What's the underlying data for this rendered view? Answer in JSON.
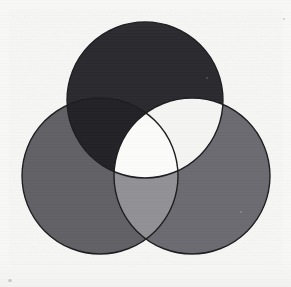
{
  "figure": {
    "type": "venn-3",
    "background_color": "#f7f7f5",
    "canvas": {
      "width": 291,
      "height": 287
    },
    "stroke": {
      "color": "#1d1d20",
      "width": 1.4
    }
  },
  "chart_data": {
    "type": "venn",
    "subtitle": "",
    "xlabel": "",
    "ylabel": "",
    "grid": false,
    "legend_position": "none",
    "sets": [
      {
        "id": "A",
        "label": "",
        "position": "top",
        "center": {
          "x": 145,
          "y": 100
        },
        "radius": 78,
        "fill": "#2b2b2f"
      },
      {
        "id": "B",
        "label": "",
        "position": "bottom-left",
        "center": {
          "x": 100,
          "y": 176
        },
        "radius": 78,
        "fill": "#616165"
      },
      {
        "id": "C",
        "label": "",
        "position": "bottom-right",
        "center": {
          "x": 192,
          "y": 176
        },
        "radius": 78,
        "fill": "#6b6b6f"
      }
    ],
    "regions": [
      {
        "id": "A-only",
        "sets": [
          "A"
        ],
        "fill": "#2b2b2f",
        "shade": "very-dark"
      },
      {
        "id": "B-only",
        "sets": [
          "B"
        ],
        "fill": "#616165",
        "shade": "medium-gray"
      },
      {
        "id": "C-only",
        "sets": [
          "C"
        ],
        "fill": "#6b6b6f",
        "shade": "medium-gray"
      },
      {
        "id": "A-and-B",
        "sets": [
          "A",
          "B"
        ],
        "fill": "#232327",
        "shade": "very-dark"
      },
      {
        "id": "A-and-C",
        "sets": [
          "A",
          "C"
        ],
        "fill": "#f4f4f2",
        "shade": "near-white"
      },
      {
        "id": "B-and-C",
        "sets": [
          "B",
          "C"
        ],
        "fill": "#919195",
        "shade": "light-gray"
      },
      {
        "id": "A-and-B-and-C",
        "sets": [
          "A",
          "B",
          "C"
        ],
        "fill": "#fbfbf9",
        "shade": "white"
      }
    ],
    "annotations": []
  },
  "marks": {
    "speck_color": "#c9c9c6"
  }
}
